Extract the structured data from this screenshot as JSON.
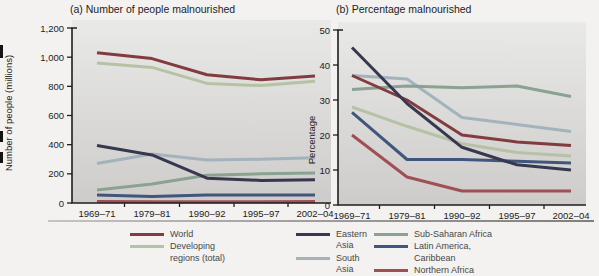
{
  "figure_titles": {
    "panel_a": "(a) Number of people malnourished",
    "panel_b": "(b) Percentage malnourished"
  },
  "colors": {
    "world": "#823c3f",
    "developing_regions": "#b7c2a5",
    "eastern_asia": "#37374f",
    "south_asia": "#a3b3bc",
    "sub_saharan_africa": "#8aa292",
    "latin_america_caribbean": "#41567c",
    "northern_africa": "#a05055",
    "axis": "#1f1f1f"
  },
  "chart_data": [
    {
      "type": "line",
      "title": "(a) Number of people malnourished",
      "ylabel": "Number of people (millions)",
      "categories": [
        "1969–71",
        "1979–81",
        "1990–92",
        "1995–97",
        "2002–04"
      ],
      "ylim": [
        0,
        1200
      ],
      "ytick_step": 200,
      "yticks": [
        "0",
        "200",
        "400",
        "600",
        "800",
        "1,000",
        "1,200"
      ],
      "grid": false,
      "legend_position": "bottom",
      "series": [
        {
          "name": "World",
          "color": "#823c3f",
          "values": [
            1030,
            990,
            880,
            845,
            870
          ]
        },
        {
          "name": "Developing regions (total)",
          "color": "#b7c2a5",
          "values": [
            960,
            930,
            820,
            805,
            835
          ]
        },
        {
          "name": "Eastern Asia",
          "color": "#37374f",
          "values": [
            395,
            330,
            170,
            155,
            160
          ]
        },
        {
          "name": "South Asia",
          "color": "#a3b3bc",
          "values": [
            270,
            335,
            295,
            300,
            310
          ]
        },
        {
          "name": "Sub-Saharan Africa",
          "color": "#8aa292",
          "values": [
            90,
            130,
            190,
            200,
            205
          ]
        },
        {
          "name": "Latin America, Caribbean",
          "color": "#41567c",
          "values": [
            55,
            45,
            55,
            55,
            55
          ]
        },
        {
          "name": "Northern Africa",
          "color": "#a05055",
          "values": [
            10,
            8,
            9,
            9,
            10
          ]
        }
      ]
    },
    {
      "type": "line",
      "title": "(b) Percentage malnourished",
      "ylabel": "Percentage",
      "categories": [
        "1969–71",
        "1979–81",
        "1990–92",
        "1995–97",
        "2002–04"
      ],
      "ylim": [
        0,
        50
      ],
      "ytick_step": 10,
      "yticks": [
        "0",
        "10",
        "20",
        "30",
        "40",
        "50"
      ],
      "grid": false,
      "legend_position": "bottom",
      "series": [
        {
          "name": "World",
          "color": "#823c3f",
          "values": [
            37,
            30,
            20,
            18,
            17
          ]
        },
        {
          "name": "Developing regions (total)",
          "color": "#b7c2a5",
          "values": [
            28,
            22.5,
            17.5,
            15,
            14
          ]
        },
        {
          "name": "Eastern Asia",
          "color": "#37374f",
          "values": [
            45,
            29,
            16.5,
            11.5,
            10
          ]
        },
        {
          "name": "South Asia",
          "color": "#a3b3bc",
          "values": [
            37,
            36,
            25,
            23,
            21
          ]
        },
        {
          "name": "Sub-Saharan Africa",
          "color": "#8aa292",
          "values": [
            33,
            34,
            33.5,
            34,
            31
          ]
        },
        {
          "name": "Latin America, Caribbean",
          "color": "#41567c",
          "values": [
            26.5,
            13,
            13,
            12.5,
            12
          ]
        },
        {
          "name": "Northern Africa",
          "color": "#a05055",
          "values": [
            20,
            8,
            4,
            4,
            4
          ]
        }
      ]
    }
  ],
  "legend": {
    "columns": [
      {
        "items": [
          {
            "label": "World",
            "color": "#823c3f"
          },
          {
            "label": "Developing regions (total)",
            "color": "#b7c2a5"
          }
        ]
      },
      {
        "items": [
          {
            "label": "Eastern Asia",
            "color": "#37374f"
          },
          {
            "label": "South Asia",
            "color": "#a3b3bc"
          }
        ]
      },
      {
        "items": [
          {
            "label": "Sub-Saharan Africa",
            "color": "#8aa292"
          },
          {
            "label": "Latin America, Caribbean",
            "color": "#41567c"
          },
          {
            "label": "Northern Africa",
            "color": "#a05055"
          }
        ]
      }
    ]
  }
}
